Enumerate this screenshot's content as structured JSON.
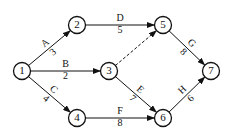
{
  "diagram": {
    "type": "activity-on-arrow network",
    "nodes": [
      {
        "id": "1",
        "label": "1",
        "x": 22,
        "y": 71
      },
      {
        "id": "2",
        "label": "2",
        "x": 77,
        "y": 25
      },
      {
        "id": "3",
        "label": "3",
        "x": 109,
        "y": 71
      },
      {
        "id": "4",
        "label": "4",
        "x": 77,
        "y": 118
      },
      {
        "id": "5",
        "label": "5",
        "x": 163,
        "y": 25
      },
      {
        "id": "6",
        "label": "6",
        "x": 163,
        "y": 118
      },
      {
        "id": "7",
        "label": "7",
        "x": 211,
        "y": 71
      }
    ],
    "edges": [
      {
        "from": "1",
        "to": "2",
        "activity": "A",
        "duration": "3",
        "dashed": false
      },
      {
        "from": "1",
        "to": "3",
        "activity": "B",
        "duration": "2",
        "dashed": false
      },
      {
        "from": "1",
        "to": "4",
        "activity": "C",
        "duration": "4",
        "dashed": false
      },
      {
        "from": "2",
        "to": "5",
        "activity": "D",
        "duration": "5",
        "dashed": false
      },
      {
        "from": "3",
        "to": "5",
        "activity": "",
        "duration": "",
        "dashed": true
      },
      {
        "from": "3",
        "to": "6",
        "activity": "E",
        "duration": "7",
        "dashed": false
      },
      {
        "from": "4",
        "to": "6",
        "activity": "F",
        "duration": "8",
        "dashed": false
      },
      {
        "from": "5",
        "to": "7",
        "activity": "G",
        "duration": "8",
        "dashed": false
      },
      {
        "from": "6",
        "to": "7",
        "activity": "H",
        "duration": "6",
        "dashed": false
      }
    ]
  }
}
